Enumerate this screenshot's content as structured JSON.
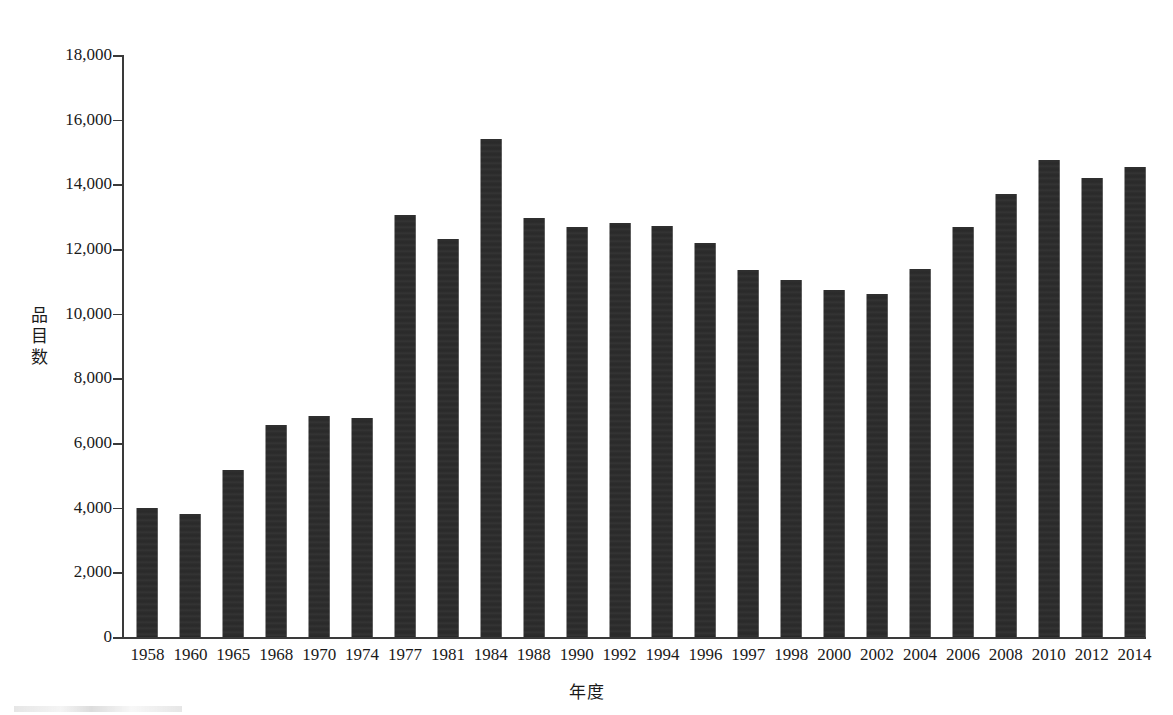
{
  "chart_data": {
    "type": "bar",
    "title": "",
    "subtitle": "",
    "xlabel": "年度",
    "ylabel": "品目数",
    "ylim": [
      0,
      18000
    ],
    "ytick_step": 2000,
    "ytick_labels": [
      "0",
      "2,000",
      "4,000",
      "6,000",
      "8,000",
      "10,000",
      "12,000",
      "14,000",
      "16,000",
      "18,000"
    ],
    "ytick_values": [
      0,
      2000,
      4000,
      6000,
      8000,
      10000,
      12000,
      14000,
      16000,
      18000
    ],
    "grid": false,
    "legend": null,
    "bar_color": "#2c2c2c",
    "axis_color": "#3a3a3a",
    "background": "#ffffff",
    "categories": [
      "1958",
      "1960",
      "1965",
      "1968",
      "1970",
      "1974",
      "1977",
      "1981",
      "1984",
      "1988",
      "1990",
      "1992",
      "1994",
      "1996",
      "1997",
      "1998",
      "2000",
      "2002",
      "2004",
      "2006",
      "2008",
      "2010",
      "2012",
      "2014"
    ],
    "values": [
      4000,
      3800,
      5150,
      6560,
      6850,
      6780,
      13050,
      12300,
      15400,
      12950,
      12680,
      12820,
      12720,
      12200,
      11350,
      11050,
      10730,
      10620,
      11380,
      12680,
      13700,
      14750,
      14200,
      14550
    ]
  }
}
